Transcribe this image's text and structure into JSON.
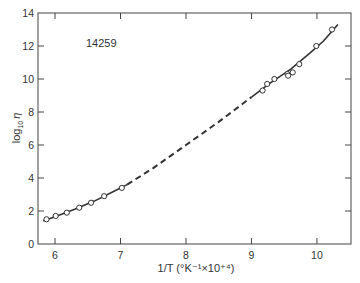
{
  "chart_data": {
    "type": "line",
    "title": "",
    "annotation": "14259",
    "xlabel": "1/T (°K⁻¹×10⁺⁴)",
    "ylabel": "log₁₀ η",
    "xlim": [
      5.74,
      10.52
    ],
    "ylim": [
      0,
      14
    ],
    "x_ticks": [
      6,
      7,
      8,
      9,
      10
    ],
    "y_ticks": [
      0,
      2,
      4,
      6,
      8,
      10,
      12,
      14
    ],
    "grid": false,
    "legend": null,
    "series": [
      {
        "name": "measured points",
        "style": "open-circle markers",
        "x": [
          5.87,
          6.01,
          6.18,
          6.37,
          6.55,
          6.75,
          7.02,
          9.17,
          9.24,
          9.35,
          9.55,
          9.56,
          9.63,
          9.73,
          9.99,
          10.23
        ],
        "y": [
          1.5,
          1.7,
          1.9,
          2.2,
          2.5,
          2.9,
          3.4,
          9.3,
          9.7,
          10.0,
          10.3,
          10.2,
          10.4,
          10.9,
          12.0,
          13.0
        ]
      },
      {
        "name": "fit (solid, low temperature range)",
        "style": "solid line",
        "x": [
          5.82,
          6.0,
          6.3,
          6.6,
          6.9,
          7.1
        ],
        "y": [
          1.4,
          1.65,
          2.1,
          2.6,
          3.2,
          3.6
        ]
      },
      {
        "name": "fit (dashed, interpolated)",
        "style": "dashed line",
        "x": [
          7.1,
          7.5,
          8.0,
          8.5,
          9.0
        ],
        "y": [
          3.6,
          4.6,
          6.0,
          7.4,
          8.9
        ]
      },
      {
        "name": "fit (solid, high temperature range)",
        "style": "solid line",
        "x": [
          9.0,
          9.3,
          9.6,
          9.9,
          10.1,
          10.32
        ],
        "y": [
          8.9,
          9.8,
          10.6,
          11.6,
          12.3,
          13.3
        ]
      }
    ]
  },
  "labels": {
    "annotation": "14259",
    "ylabel_main": "log",
    "ylabel_sub": "10",
    "ylabel_symbol": "η",
    "xlabel": "1/T (°K⁻¹×10⁺⁴)",
    "x_tick_labels": [
      "6",
      "7",
      "8",
      "9",
      "10"
    ],
    "y_tick_labels": [
      "0",
      "2",
      "4",
      "6",
      "8",
      "10",
      "12",
      "14"
    ]
  }
}
